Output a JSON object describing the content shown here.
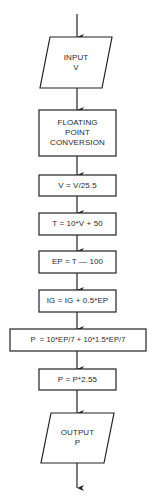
{
  "diagram": {
    "type": "flowchart",
    "direction": "top-to-bottom",
    "colors": {
      "stroke": "#222222",
      "text": "#2a2a2a",
      "background": "#ffffff"
    },
    "nodes": [
      {
        "id": "input",
        "shape": "parallelogram",
        "lines": [
          "INPUT",
          "V"
        ]
      },
      {
        "id": "fp_conversion",
        "shape": "rectangle",
        "lines": [
          "FLOATING",
          "POINT",
          "CONVERSION"
        ]
      },
      {
        "id": "scale_v",
        "shape": "rectangle",
        "lines": [
          "V = V/25.5"
        ]
      },
      {
        "id": "compute_t",
        "shape": "rectangle",
        "lines": [
          "T = 10*V + 50"
        ]
      },
      {
        "id": "compute_ep",
        "shape": "rectangle",
        "lines": [
          "EP = T — 100"
        ]
      },
      {
        "id": "compute_ig",
        "shape": "rectangle",
        "lines": [
          "IG = IG + 0.5*EP"
        ]
      },
      {
        "id": "compute_p",
        "shape": "rectangle",
        "lines": [
          "P  = 10*EP/7 + 10*1.5*EP/7"
        ]
      },
      {
        "id": "scale_p",
        "shape": "rectangle",
        "lines": [
          "P = P*2.55"
        ]
      },
      {
        "id": "output",
        "shape": "parallelogram",
        "lines": [
          "OUTPUT",
          "P"
        ]
      }
    ],
    "edges": [
      {
        "from": "start",
        "to": "input"
      },
      {
        "from": "input",
        "to": "fp_conversion"
      },
      {
        "from": "fp_conversion",
        "to": "scale_v"
      },
      {
        "from": "scale_v",
        "to": "compute_t"
      },
      {
        "from": "compute_t",
        "to": "compute_ep"
      },
      {
        "from": "compute_ep",
        "to": "compute_ig"
      },
      {
        "from": "compute_ig",
        "to": "compute_p"
      },
      {
        "from": "compute_p",
        "to": "scale_p"
      },
      {
        "from": "scale_p",
        "to": "output"
      },
      {
        "from": "output",
        "to": "end"
      }
    ]
  }
}
